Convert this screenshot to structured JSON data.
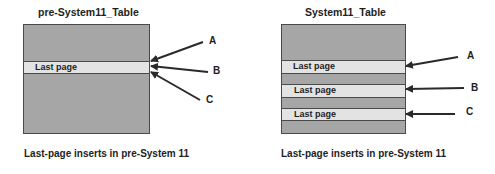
{
  "left_diagram": {
    "title": "pre-System11_Table",
    "bands": [
      {
        "label": "Last page"
      }
    ],
    "arrows": [
      {
        "label": "A"
      },
      {
        "label": "B"
      },
      {
        "label": "C"
      }
    ],
    "caption": "Last-page inserts in pre-System 11"
  },
  "right_diagram": {
    "title": "System11_Table",
    "bands": [
      {
        "label": "Last page"
      },
      {
        "label": "Last page"
      },
      {
        "label": "Last page"
      }
    ],
    "arrows": [
      {
        "label": "A"
      },
      {
        "label": "B"
      },
      {
        "label": "C"
      }
    ],
    "caption": "Last-page inserts in pre-System 11"
  },
  "colors": {
    "table_fill": "#a6a6a6",
    "band_fill": "#e3e3e3",
    "outline": "#4a4a4a",
    "text": "#1e1e1e"
  }
}
